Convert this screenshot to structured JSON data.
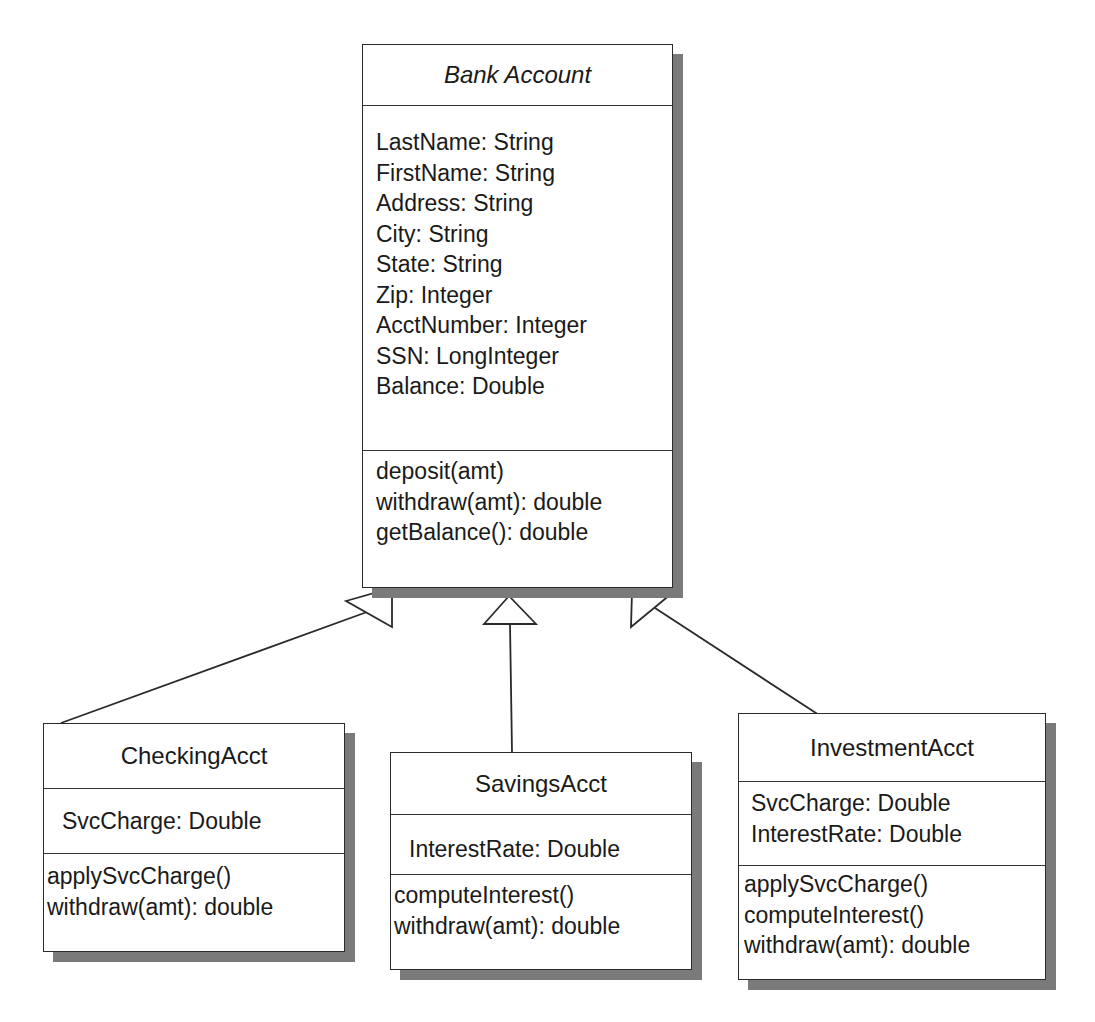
{
  "diagram": {
    "type": "UML class diagram",
    "relationship": "inheritance (generalization)",
    "base_class": {
      "name": "Bank Account",
      "abstract": true,
      "attributes": [
        "LastName: String",
        "FirstName: String",
        "Address: String",
        "City: String",
        "State: String",
        "Zip: Integer",
        "AcctNumber: Integer",
        "SSN: LongInteger",
        "Balance: Double"
      ],
      "methods": [
        "deposit(amt)",
        "withdraw(amt): double",
        "getBalance(): double"
      ]
    },
    "subclasses": [
      {
        "name": "CheckingAcct",
        "attributes": [
          "SvcCharge: Double"
        ],
        "methods": [
          "applySvcCharge()",
          "withdraw(amt): double"
        ]
      },
      {
        "name": "SavingsAcct",
        "attributes": [
          "InterestRate: Double"
        ],
        "methods": [
          "computeInterest()",
          "withdraw(amt): double"
        ]
      },
      {
        "name": "InvestmentAcct",
        "attributes": [
          "SvcCharge: Double",
          "InterestRate: Double"
        ],
        "methods": [
          "applySvcCharge()",
          "computeInterest()",
          "withdraw(amt): double"
        ]
      }
    ],
    "colors": {
      "line": "#2a2a2a",
      "shadow": "#7a7a7a",
      "background": "#ffffff"
    }
  }
}
